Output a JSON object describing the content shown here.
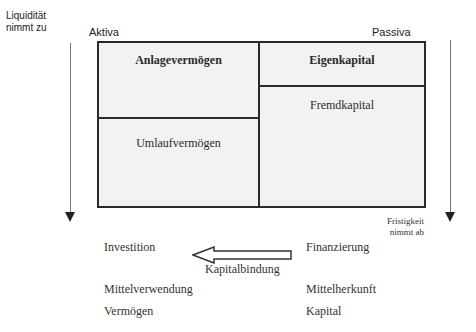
{
  "labels": {
    "liquidity_line1": "Liquidität",
    "liquidity_line2": "nimmt zu",
    "aktiva": "Aktiva",
    "passiva": "Passiva",
    "maturity_line1": "Fristigkeit",
    "maturity_line2": "nimmt ab"
  },
  "balance_sheet": {
    "assets": [
      {
        "label": "Anlagevermögen",
        "bold": true
      },
      {
        "label": "Umlaufvermögen",
        "bold": false
      }
    ],
    "liabilities": [
      {
        "label": "Eigenkapital",
        "bold": true
      },
      {
        "label": "Fremdkapital",
        "bold": false
      }
    ]
  },
  "bottom": {
    "left": [
      "Investition",
      "Mittelverwendung",
      "Vermögen"
    ],
    "right": [
      "Finanzierung",
      "Mittelherkunft",
      "Kapital"
    ],
    "arrow_label": "Kapitalbindung"
  }
}
